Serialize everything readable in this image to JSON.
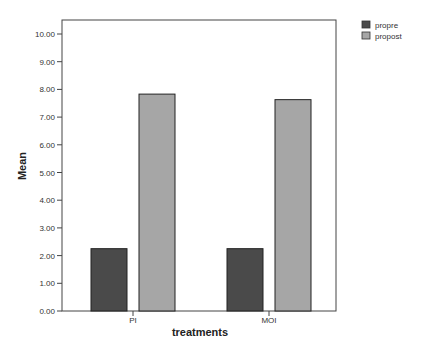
{
  "chart_data": {
    "type": "bar",
    "title": "",
    "xlabel": "treatments",
    "ylabel": "Mean",
    "categories": [
      "PI",
      "MOI"
    ],
    "series": [
      {
        "name": "propre",
        "color": "#4a4a4a",
        "values": [
          2.25,
          2.25
        ]
      },
      {
        "name": "propost",
        "color": "#a6a6a6",
        "values": [
          7.83,
          7.63
        ]
      }
    ],
    "ylim": [
      0,
      10
    ],
    "yticks": [
      "0.00",
      "1.00",
      "2.00",
      "3.00",
      "4.00",
      "5.00",
      "6.00",
      "7.00",
      "8.00",
      "9.00",
      "10.00"
    ],
    "grid": false,
    "legend_position": "top-right"
  }
}
